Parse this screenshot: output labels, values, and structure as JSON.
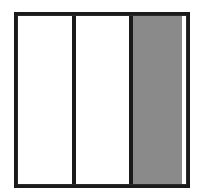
{
  "figure": {
    "background_color": "#ffffff",
    "frame": {
      "stroke_color": "#1a1a1a",
      "stroke_width_px": 4,
      "x_px": 14,
      "y_px": 12,
      "width_px": 176,
      "height_px": 176
    },
    "divider": {
      "stroke_color": "#1a1a1a",
      "stroke_width_px": 4,
      "count": 2
    },
    "panels": [
      {
        "id": "panel-1",
        "label": "",
        "fill": "white",
        "fill_color": "#ffffff",
        "shaded": false,
        "width_px": 54
      },
      {
        "id": "panel-2",
        "label": "",
        "fill": "white",
        "fill_color": "#ffffff",
        "shaded": false,
        "width_px": 57
      },
      {
        "id": "panel-3",
        "label": "",
        "fill": "gray",
        "fill_color": "#8a8a8a",
        "shaded": true,
        "width_px": 53
      }
    ]
  }
}
